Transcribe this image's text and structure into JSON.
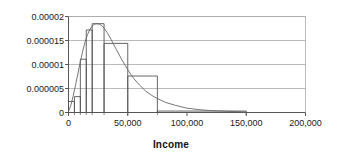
{
  "chart_data": {
    "type": "bar",
    "title": "",
    "subtitle": "",
    "xlabel": "Income",
    "ylabel": "",
    "xlim": [
      0,
      200000
    ],
    "ylim": [
      0,
      2e-05
    ],
    "grid": true,
    "legend": null,
    "x_tick_labels": [
      "0",
      "50,000",
      "100,000",
      "150,000",
      "200,000"
    ],
    "x_tick_values": [
      0,
      50000,
      100000,
      150000,
      200000
    ],
    "y_tick_labels": [
      "0",
      "0.000005",
      "0.00001",
      "0.000015",
      "0.00002"
    ],
    "y_tick_values": [
      0,
      5e-06,
      1e-05,
      1.5e-05,
      2e-05
    ],
    "x_minor_tick_values": [
      0,
      5000,
      10000,
      15000,
      20000,
      30000,
      50000,
      75000,
      150000
    ],
    "bins": [
      {
        "start": 0,
        "end": 5000,
        "value": 2.3e-06
      },
      {
        "start": 5000,
        "end": 10000,
        "value": 3.3e-06
      },
      {
        "start": 10000,
        "end": 15000,
        "value": 1.11e-05
      },
      {
        "start": 15000,
        "end": 20000,
        "value": 1.72e-05
      },
      {
        "start": 20000,
        "end": 30000,
        "value": 1.85e-05
      },
      {
        "start": 30000,
        "end": 50000,
        "value": 1.44e-05
      },
      {
        "start": 50000,
        "end": 75000,
        "value": 7.6e-06
      },
      {
        "start": 75000,
        "end": 150000,
        "value": 3e-07
      }
    ],
    "categories": [
      "0-5,000",
      "5,000-10,000",
      "10,000-15,000",
      "15,000-20,000",
      "20,000-30,000",
      "30,000-50,000",
      "50,000-75,000",
      "75,000-150,000"
    ],
    "values": [
      2.3e-06,
      3.3e-06,
      1.11e-05,
      1.72e-05,
      1.85e-05,
      1.44e-05,
      7.6e-06,
      3e-07
    ],
    "overlay_curve": {
      "name": "fitted density",
      "x": [
        0,
        2000,
        4000,
        6000,
        8000,
        10000,
        12000,
        14000,
        16000,
        18000,
        20000,
        22000,
        24000,
        26000,
        28000,
        30000,
        33000,
        36000,
        40000,
        45000,
        50000,
        55000,
        60000,
        65000,
        70000,
        75000,
        82000,
        90000,
        100000,
        110000,
        120000,
        130000,
        140000,
        150000
      ],
      "y": [
        2e-07,
        1.5e-06,
        3.5e-06,
        5.8e-06,
        8.2e-06,
        1.06e-05,
        1.28e-05,
        1.47e-05,
        1.62e-05,
        1.73e-05,
        1.8e-05,
        1.84e-05,
        1.85e-05,
        1.84e-05,
        1.81e-05,
        1.76e-05,
        1.65e-05,
        1.52e-05,
        1.33e-05,
        1.1e-05,
        8.9e-06,
        7.1e-06,
        5.7e-06,
        4.5e-06,
        3.6e-06,
        2.9e-06,
        2.1e-06,
        1.5e-06,
        9e-07,
        6e-07,
        4e-07,
        3e-07,
        2e-07,
        1e-07
      ]
    },
    "colors": {
      "bar_stroke": "#555555",
      "curve_stroke": "#666666",
      "grid": "#aaaaaa",
      "axis": "#555555",
      "text": "#1a1a1a"
    }
  }
}
